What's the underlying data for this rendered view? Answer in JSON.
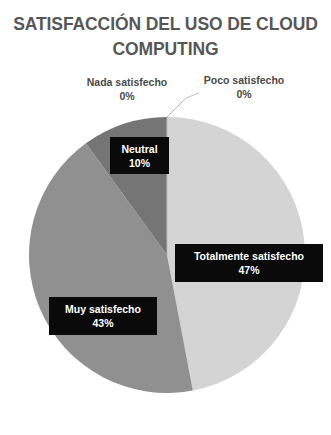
{
  "chart_data": {
    "type": "pie",
    "title": "SATISFACCIÓN DEL USO DE CLOUD\nCOMPUTING",
    "title_line1": "SATISFACCIÓN DEL USO DE CLOUD",
    "title_line2": "COMPUTING",
    "categories": [
      "Totalmente satisfecho",
      "Muy satisfecho",
      "Neutral",
      "Poco satisfecho",
      "Nada satisfecho"
    ],
    "values": [
      47,
      43,
      10,
      0,
      0
    ],
    "value_labels": [
      "47%",
      "43%",
      "10%",
      "0%",
      "0%"
    ],
    "units": "percent",
    "total": 100,
    "start_angle_deg": 0,
    "direction": "clockwise",
    "legend": "none",
    "labels_position": "on-slice-and-callout",
    "slice_colors": [
      "#d4d4d4",
      "#909090",
      "#757575",
      "#c9c9c9",
      "#b0b0b0"
    ],
    "slices": [
      {
        "name": "Totalmente satisfecho",
        "value": 47,
        "value_label": "47%",
        "color": "#d4d4d4",
        "label_style": "black-box",
        "text_color": "#ffffff"
      },
      {
        "name": "Muy satisfecho",
        "value": 43,
        "value_label": "43%",
        "color": "#909090",
        "label_style": "black-box",
        "text_color": "#ffffff"
      },
      {
        "name": "Neutral",
        "value": 10,
        "value_label": "10%",
        "color": "#757575",
        "label_style": "black-box",
        "text_color": "#ffffff"
      },
      {
        "name": "Poco satisfecho",
        "value": 0,
        "value_label": "0%",
        "color": "#c9c9c9",
        "label_style": "outside-leader",
        "text_color": "#4a4a4a"
      },
      {
        "name": "Nada satisfecho",
        "value": 0,
        "value_label": "0%",
        "color": "#b0b0b0",
        "label_style": "outside-leader",
        "text_color": "#4a4a4a"
      }
    ]
  },
  "labels": {
    "nada": "Nada satisfecho\n0%",
    "poco": "Poco satisfecho\n0%",
    "neutral_name": "Neutral",
    "neutral_value": "10%",
    "totalmente_name": "Totalmente satisfecho",
    "totalmente_value": "47%",
    "muy_name": "Muy satisfecho",
    "muy_value": "43%"
  },
  "colors": {
    "background": "#ffffff",
    "title_text": "#575757",
    "callout_background": "#0a0a0a",
    "callout_text": "#ffffff",
    "outside_label_text": "#4a4a4a",
    "leader_line": "#bdbdbd"
  }
}
